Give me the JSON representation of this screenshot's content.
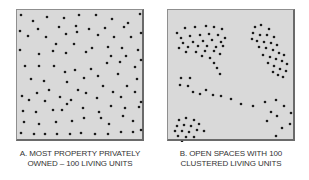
{
  "figure": {
    "panels": [
      {
        "id": "A",
        "caption_line1": "A. MOST PROPERTY PRIVATELY",
        "caption_line2": "OWNED – 100 LIVING UNITS",
        "layout": "scattered",
        "unit_count": 100,
        "background": "#d9d9d9",
        "dot_color": "#1a1a1a",
        "dots": [
          [
            4,
            5
          ],
          [
            16,
            11
          ],
          [
            30,
            7
          ],
          [
            47,
            8
          ],
          [
            62,
            5
          ],
          [
            79,
            5
          ],
          [
            95,
            9
          ],
          [
            111,
            13
          ],
          [
            123,
            4
          ],
          [
            21,
            19
          ],
          [
            42,
            17
          ],
          [
            59,
            16
          ],
          [
            72,
            19
          ],
          [
            88,
            18
          ],
          [
            107,
            17
          ],
          [
            3,
            21
          ],
          [
            11,
            26
          ],
          [
            29,
            27
          ],
          [
            49,
            24
          ],
          [
            60,
            22
          ],
          [
            81,
            25
          ],
          [
            97,
            27
          ],
          [
            114,
            27
          ],
          [
            124,
            23
          ],
          [
            39,
            34
          ],
          [
            57,
            34
          ],
          [
            75,
            38
          ],
          [
            91,
            37
          ],
          [
            105,
            38
          ],
          [
            3,
            40
          ],
          [
            22,
            44
          ],
          [
            36,
            41
          ],
          [
            49,
            43
          ],
          [
            69,
            42
          ],
          [
            94,
            46
          ],
          [
            109,
            46
          ],
          [
            121,
            40
          ],
          [
            8,
            56
          ],
          [
            22,
            56
          ],
          [
            37,
            56
          ],
          [
            48,
            62
          ],
          [
            58,
            60
          ],
          [
            74,
            59
          ],
          [
            90,
            53
          ],
          [
            103,
            52
          ],
          [
            118,
            57
          ],
          [
            124,
            50
          ],
          [
            14,
            69
          ],
          [
            27,
            71
          ],
          [
            50,
            72
          ],
          [
            67,
            68
          ],
          [
            81,
            66
          ],
          [
            101,
            64
          ],
          [
            120,
            69
          ],
          [
            5,
            86
          ],
          [
            20,
            83
          ],
          [
            28,
            91
          ],
          [
            43,
            87
          ],
          [
            54,
            90
          ],
          [
            69,
            83
          ],
          [
            80,
            88
          ],
          [
            96,
            82
          ],
          [
            104,
            87
          ],
          [
            118,
            82
          ],
          [
            6,
            101
          ],
          [
            19,
            102
          ],
          [
            36,
            100
          ],
          [
            50,
            94
          ],
          [
            66,
            98
          ],
          [
            82,
            102
          ],
          [
            94,
            96
          ],
          [
            108,
            98
          ],
          [
            122,
            97
          ],
          [
            7,
            112
          ],
          [
            22,
            114
          ],
          [
            39,
            112
          ],
          [
            55,
            111
          ],
          [
            67,
            108
          ],
          [
            84,
            108
          ],
          [
            92,
            114
          ],
          [
            106,
            106
          ],
          [
            116,
            111
          ],
          [
            4,
            123
          ],
          [
            17,
            124
          ],
          [
            28,
            124
          ],
          [
            40,
            124
          ],
          [
            53,
            124
          ],
          [
            64,
            123
          ],
          [
            78,
            124
          ],
          [
            91,
            124
          ],
          [
            104,
            122
          ],
          [
            116,
            122
          ],
          [
            124,
            120
          ],
          [
            32,
            80
          ],
          [
            61,
            80
          ],
          [
            86,
            76
          ],
          [
            110,
            76
          ],
          [
            12,
            90
          ],
          [
            124,
            92
          ],
          [
            45,
            100
          ]
        ]
      },
      {
        "id": "B",
        "caption_line1": "B. OPEN SPACES WITH 100",
        "caption_line2": "CLUSTERED LIVING UNITS",
        "layout": "clustered",
        "unit_count": 100,
        "background": "#d9d9d9",
        "dot_color": "#1a1a1a",
        "dots": [
          [
            9,
            23
          ],
          [
            17,
            18
          ],
          [
            27,
            17
          ],
          [
            38,
            16
          ],
          [
            46,
            17
          ],
          [
            54,
            19
          ],
          [
            13,
            28
          ],
          [
            22,
            26
          ],
          [
            32,
            25
          ],
          [
            41,
            24
          ],
          [
            50,
            25
          ],
          [
            57,
            28
          ],
          [
            15,
            33
          ],
          [
            25,
            32
          ],
          [
            35,
            31
          ],
          [
            44,
            30
          ],
          [
            53,
            32
          ],
          [
            11,
            38
          ],
          [
            20,
            37
          ],
          [
            30,
            36
          ],
          [
            39,
            36
          ],
          [
            48,
            37
          ],
          [
            55,
            36
          ],
          [
            18,
            42
          ],
          [
            28,
            42
          ],
          [
            37,
            41
          ],
          [
            46,
            41
          ],
          [
            52,
            44
          ],
          [
            34,
            46
          ],
          [
            42,
            48
          ],
          [
            46,
            53
          ],
          [
            49,
            58
          ],
          [
            52,
            64
          ],
          [
            87,
            17
          ],
          [
            93,
            15
          ],
          [
            101,
            19
          ],
          [
            85,
            23
          ],
          [
            92,
            25
          ],
          [
            99,
            25
          ],
          [
            106,
            27
          ],
          [
            84,
            29
          ],
          [
            89,
            31
          ],
          [
            96,
            32
          ],
          [
            103,
            33
          ],
          [
            109,
            35
          ],
          [
            91,
            37
          ],
          [
            98,
            38
          ],
          [
            105,
            40
          ],
          [
            111,
            43
          ],
          [
            116,
            45
          ],
          [
            95,
            45
          ],
          [
            102,
            47
          ],
          [
            108,
            49
          ],
          [
            114,
            51
          ],
          [
            119,
            54
          ],
          [
            100,
            53
          ],
          [
            106,
            56
          ],
          [
            112,
            59
          ],
          [
            118,
            61
          ],
          [
            105,
            62
          ],
          [
            110,
            65
          ],
          [
            115,
            67
          ],
          [
            13,
            68
          ],
          [
            22,
            68
          ],
          [
            12,
            75
          ],
          [
            20,
            76
          ],
          [
            25,
            82
          ],
          [
            32,
            84
          ],
          [
            38,
            80
          ],
          [
            45,
            85
          ],
          [
            53,
            86
          ],
          [
            63,
            89
          ],
          [
            73,
            94
          ],
          [
            85,
            96
          ],
          [
            97,
            92
          ],
          [
            108,
            90
          ],
          [
            116,
            96
          ],
          [
            103,
            102
          ],
          [
            123,
            103
          ],
          [
            109,
            106
          ],
          [
            99,
            111
          ],
          [
            114,
            118
          ],
          [
            108,
            126
          ],
          [
            122,
            114
          ],
          [
            11,
            110
          ],
          [
            18,
            108
          ],
          [
            26,
            110
          ],
          [
            9,
            116
          ],
          [
            16,
            115
          ],
          [
            23,
            116
          ],
          [
            31,
            114
          ],
          [
            7,
            121
          ],
          [
            14,
            121
          ],
          [
            21,
            122
          ],
          [
            29,
            120
          ],
          [
            36,
            121
          ],
          [
            10,
            126
          ],
          [
            18,
            127
          ],
          [
            26,
            127
          ],
          [
            14,
            132
          ]
        ]
      }
    ]
  }
}
